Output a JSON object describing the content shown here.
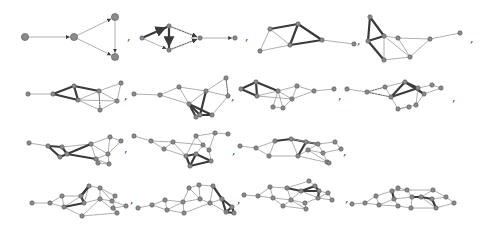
{
  "separator": ",",
  "colors": {
    "node_fill": "#8a8a8a",
    "node_stroke": "#555555",
    "thin_edge": "#9a9a9a",
    "thick_edge": "#3a3a3a",
    "dashed_edge": "#6a6a6a"
  },
  "graphs": [
    {
      "id": 1,
      "nodes": 4,
      "edges": [
        [
          0,
          1,
          "thin"
        ],
        [
          1,
          2,
          "thin"
        ],
        [
          1,
          3,
          "thin"
        ],
        [
          2,
          3,
          "thin"
        ]
      ],
      "directed": true
    },
    {
      "id": 2,
      "nodes": 5,
      "edges": [
        [
          0,
          1,
          "thick"
        ],
        [
          0,
          2,
          "thin"
        ],
        [
          1,
          2,
          "thick"
        ],
        [
          1,
          3,
          "dashed"
        ],
        [
          2,
          3,
          "dashed"
        ],
        [
          3,
          4,
          "thin"
        ]
      ],
      "directed": true
    },
    {
      "id": 3,
      "nodes": 6,
      "edges": [
        [
          0,
          1,
          "thin"
        ],
        [
          0,
          2,
          "thick"
        ],
        [
          0,
          3,
          "thin"
        ],
        [
          2,
          3,
          "thick"
        ],
        [
          2,
          4,
          "thick"
        ],
        [
          3,
          4,
          "thick"
        ],
        [
          1,
          3,
          "thin"
        ],
        [
          4,
          5,
          "thin"
        ]
      ]
    },
    {
      "id": 4,
      "nodes": 8,
      "edges": [
        [
          0,
          1,
          "thick"
        ],
        [
          0,
          2,
          "thick"
        ],
        [
          1,
          2,
          "thick"
        ],
        [
          1,
          3,
          "thick"
        ],
        [
          2,
          3,
          "thin"
        ],
        [
          2,
          4,
          "thin"
        ],
        [
          2,
          5,
          "thin"
        ],
        [
          3,
          4,
          "thin"
        ],
        [
          4,
          5,
          "thin"
        ],
        [
          5,
          6,
          "thin"
        ],
        [
          6,
          7,
          "thin"
        ]
      ]
    },
    {
      "id": 5,
      "nodes": 9
    },
    {
      "id": 6,
      "nodes": 10
    },
    {
      "id": 7,
      "nodes": 10
    },
    {
      "id": 8,
      "nodes": 11
    },
    {
      "id": 9,
      "nodes": 11
    },
    {
      "id": 10,
      "nodes": 12
    },
    {
      "id": 11,
      "nodes": 13
    },
    {
      "id": 12,
      "nodes": 14
    },
    {
      "id": 13,
      "nodes": 15
    },
    {
      "id": 14,
      "nodes": 16
    },
    {
      "id": 15,
      "nodes": 17
    }
  ]
}
